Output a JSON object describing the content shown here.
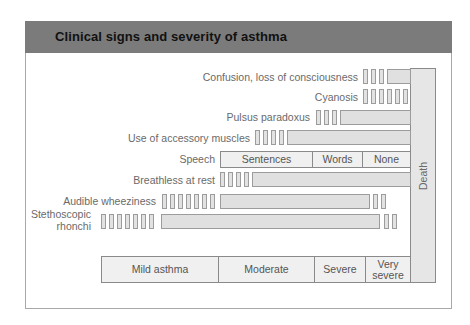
{
  "title": "Clinical signs and severity of asthma",
  "signs": [
    {
      "label": "Confusion, loss of consciousness",
      "small_bars_before": 3,
      "bar_start": 387,
      "bar_end": 410,
      "small_bars_after": 0
    },
    {
      "label": "Cyanosis",
      "small_bars_before": 6,
      "bar_start": null,
      "bar_end": null,
      "small_bars_after": 0
    },
    {
      "label": "Pulsus paradoxus",
      "small_bars_before": 3,
      "bar_start": 340,
      "bar_end": 410,
      "small_bars_after": 0
    },
    {
      "label": "Use of accessory muscles",
      "small_bars_before": 4,
      "bar_start": 287,
      "bar_end": 410,
      "small_bars_after": 0
    },
    {
      "label": "Speech",
      "segments": [
        "Sentences",
        "Words",
        "None"
      ]
    },
    {
      "label": "Breathless at rest",
      "small_bars_before": 4,
      "bar_start": 252,
      "bar_end": 410,
      "small_bars_after": 0
    },
    {
      "label": "Audible wheeziness",
      "small_bars_before": 7,
      "bar_start": 220,
      "bar_end": 370,
      "small_bars_after": 2
    },
    {
      "label_line1": "Stethoscopic",
      "label_line2": "rhonchi",
      "small_bars_before": 7,
      "bar_start": 161,
      "bar_end": 380,
      "small_bars_after": 2
    }
  ],
  "speech": {
    "label": "Speech",
    "sentences": "Sentences",
    "words": "Words",
    "none": "None"
  },
  "severity": {
    "mild": "Mild asthma",
    "moderate": "Moderate",
    "severe": "Severe",
    "very_line1": "Very",
    "very_line2": "severe"
  },
  "death_label": "Death",
  "colors": {
    "header": "#7b7b7b",
    "bar_fill": "#e0e0e0",
    "bar_border": "#9c9c9c",
    "label_text": "#6a6a6a"
  }
}
